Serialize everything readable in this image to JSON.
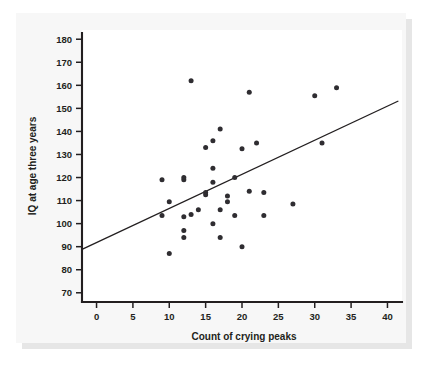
{
  "chart_data": {
    "type": "scatter",
    "title": "",
    "xlabel": "Count of crying peaks",
    "ylabel": "IQ at age three years",
    "xlim": [
      -2,
      42
    ],
    "ylim": [
      66,
      184
    ],
    "xticks": [
      0,
      5,
      10,
      15,
      20,
      25,
      30,
      35,
      40
    ],
    "yticks": [
      70,
      80,
      90,
      100,
      110,
      120,
      130,
      140,
      150,
      160,
      170,
      180
    ],
    "xtick_labels": [
      "0",
      "5",
      "10",
      "15",
      "20",
      "25",
      "30",
      "35",
      "40"
    ],
    "ytick_labels": [
      "70",
      "80",
      "90",
      "100",
      "110",
      "120",
      "130",
      "140",
      "150",
      "160",
      "170",
      "180"
    ],
    "grid": false,
    "legend": false,
    "marker_color": "#2f2d31",
    "line_color": "#231f20",
    "trendline": {
      "label": "linear fit",
      "x_start": -2,
      "y_start": 88.8,
      "x_end": 41.5,
      "y_end": 153.2
    },
    "points": [
      {
        "x": 9,
        "y": 103.5
      },
      {
        "x": 9,
        "y": 119
      },
      {
        "x": 10,
        "y": 109.5
      },
      {
        "x": 10,
        "y": 87
      },
      {
        "x": 12,
        "y": 119
      },
      {
        "x": 12,
        "y": 120
      },
      {
        "x": 12,
        "y": 103
      },
      {
        "x": 12,
        "y": 97
      },
      {
        "x": 12,
        "y": 94
      },
      {
        "x": 13,
        "y": 162
      },
      {
        "x": 13,
        "y": 104
      },
      {
        "x": 14,
        "y": 106
      },
      {
        "x": 15,
        "y": 133
      },
      {
        "x": 15,
        "y": 113.5
      },
      {
        "x": 15,
        "y": 112.5
      },
      {
        "x": 16,
        "y": 136
      },
      {
        "x": 16,
        "y": 124
      },
      {
        "x": 16,
        "y": 118
      },
      {
        "x": 16,
        "y": 100
      },
      {
        "x": 17,
        "y": 141
      },
      {
        "x": 17,
        "y": 106
      },
      {
        "x": 17,
        "y": 94
      },
      {
        "x": 18,
        "y": 112
      },
      {
        "x": 18,
        "y": 109.5
      },
      {
        "x": 19,
        "y": 120
      },
      {
        "x": 19,
        "y": 103.5
      },
      {
        "x": 20,
        "y": 132.5
      },
      {
        "x": 20,
        "y": 90
      },
      {
        "x": 21,
        "y": 114
      },
      {
        "x": 21,
        "y": 157
      },
      {
        "x": 22,
        "y": 135
      },
      {
        "x": 23,
        "y": 113.5
      },
      {
        "x": 23,
        "y": 103.5
      },
      {
        "x": 27,
        "y": 108.5
      },
      {
        "x": 30,
        "y": 155.5
      },
      {
        "x": 31,
        "y": 135
      },
      {
        "x": 33,
        "y": 159
      }
    ]
  }
}
